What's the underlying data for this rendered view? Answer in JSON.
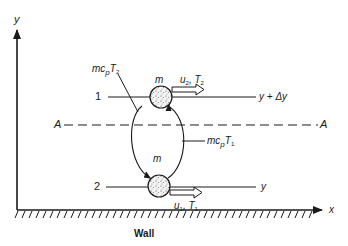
{
  "diagram": {
    "type": "turbulent-transport-schematic",
    "axes": {
      "y_label": "y",
      "x_label": "x",
      "wall_label": "Wall"
    },
    "plane": {
      "left_label": "A",
      "right_label": "A"
    },
    "levels": [
      {
        "index_label": "1",
        "line_label_main": "y + Δy",
        "particle_label": "m",
        "velocity_label": "u",
        "velocity_sub": "2",
        "temp_label": "T",
        "temp_sub": "2",
        "flux_label_main": "mc",
        "flux_label_p": "p",
        "flux_T": "T",
        "flux_sub": "2"
      },
      {
        "index_label": "2",
        "line_label_main": "y",
        "particle_label": "m",
        "velocity_label": "u",
        "velocity_sub": "1",
        "temp_label": "T",
        "temp_sub": "1",
        "flux_label_main": "mc",
        "flux_label_p": "p",
        "flux_T": "T",
        "flux_sub": "1"
      }
    ],
    "colors": {
      "ink": "#1a1a1a",
      "background": "#ffffff"
    }
  }
}
